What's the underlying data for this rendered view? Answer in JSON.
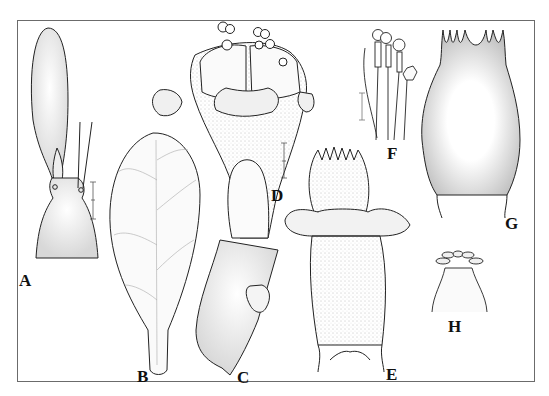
{
  "figure": {
    "type": "botanical-illustration-plate",
    "panels": [
      {
        "id": "A",
        "label": "A",
        "description": "flower bud / ovary with long petal and stamens",
        "scale_bar": true
      },
      {
        "id": "B",
        "label": "B",
        "description": "spatulate leaf with reticulate venation",
        "scale_bar": false
      },
      {
        "id": "C",
        "label": "C",
        "description": "lower part of fruit / ovary with lobed appendage",
        "scale_bar": false
      },
      {
        "id": "D",
        "label": "D",
        "description": "flower top with stamens, stippled corolla tube and lobes",
        "scale_bar": true
      },
      {
        "id": "E",
        "label": "E",
        "description": "stippled ovary with toothed top and wing-like lobes",
        "scale_bar": false
      },
      {
        "id": "F",
        "label": "F",
        "description": "stamens and staminode with anthers",
        "scale_bar": true
      },
      {
        "id": "G",
        "label": "G",
        "description": "hairy calyx tube with narrow teeth",
        "scale_bar": false
      },
      {
        "id": "H",
        "label": "H",
        "description": "small cup with recurved lobes at top",
        "scale_bar": false
      }
    ],
    "colors": {
      "ink": "#222222",
      "stipple": "#8a8a8a",
      "frame": "#6b6b6b",
      "background": "#ffffff"
    }
  }
}
